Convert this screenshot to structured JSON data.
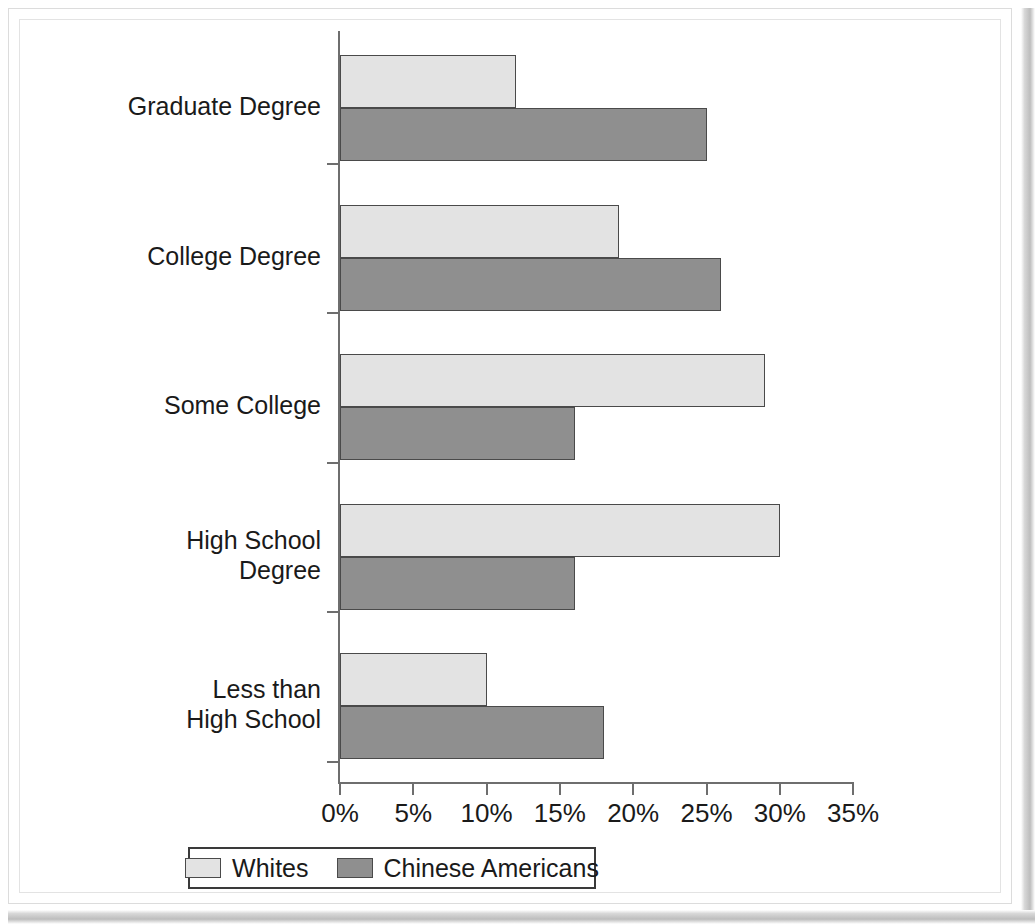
{
  "chart_data": {
    "type": "bar",
    "orientation": "horizontal",
    "title": "",
    "xlabel": "",
    "ylabel": "",
    "xlim": [
      0,
      35
    ],
    "xtick_labels": [
      "0%",
      "5%",
      "10%",
      "15%",
      "20%",
      "25%",
      "30%",
      "35%"
    ],
    "xtick_values": [
      0,
      5,
      10,
      15,
      20,
      25,
      30,
      35
    ],
    "grid": false,
    "legend_position": "bottom",
    "categories": [
      "Graduate Degree",
      "College Degree",
      "Some College",
      "High School\nDegree",
      "Less than\nHigh School"
    ],
    "series": [
      {
        "name": "Whites",
        "color": "#e3e3e3",
        "values": [
          12,
          19,
          29,
          30,
          10
        ]
      },
      {
        "name": "Chinese Americans",
        "color": "#8f8f8f",
        "values": [
          25,
          26,
          16,
          16,
          18
        ]
      }
    ]
  },
  "legend": {
    "entries": [
      {
        "label": "Whites",
        "swatch": "whites"
      },
      {
        "label": "Chinese Americans",
        "swatch": "chinese"
      }
    ]
  }
}
